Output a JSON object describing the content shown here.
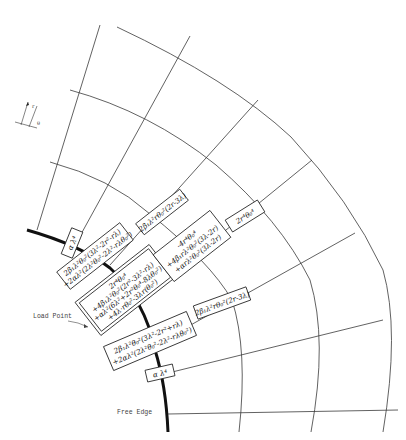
{
  "diagram": {
    "type": "finite-difference stencil on polar grid",
    "labels": {
      "load_point": "Load Point",
      "free_edge": "Free Edge"
    },
    "axes_marker": {
      "r": "r",
      "theta": "θ"
    },
    "stencil_boxes": [
      {
        "id": "alpha-top",
        "lines": [
          "α λ⁴"
        ]
      },
      {
        "id": "beta-upper-left",
        "lines": [
          "2β₁λ²θ₀²(3λ²-2r²-rλ)",
          "+2αλ²(2λ²θ₀²-2λ²-rλθ₀²)"
        ]
      },
      {
        "id": "beta-mid-upper",
        "lines": [
          "2β₁λ²rθ₀²(2r-3λ)"
        ]
      },
      {
        "id": "center-load",
        "lines": [
          "2r⁴θ₀⁴",
          "+4β₁λ²θ₀²(2r²-3λ²-rλ)",
          "+αλ²(6λ²+2r²θ₀⁴-8λθ₀²)",
          "+4λ·rθ₀²-3λr(θ₀²)"
        ]
      },
      {
        "id": "neg4r-box",
        "lines": [
          "-4r⁴θ₀⁴",
          "+4β₁rλ²θ₀²(3λ-2r)",
          "+αrλ²θ₀²(3λ-2r)"
        ]
      },
      {
        "id": "2r4-box",
        "lines": [
          "2r⁴θ₀⁴"
        ]
      },
      {
        "id": "beta-lower-left",
        "lines": [
          "2β₁λ²θ₀²(3λ²-2r²+rλ)",
          "+2αλ²(2λ²θ₀²-2λ²-rλθ₀²)"
        ]
      },
      {
        "id": "beta-mid-lower",
        "lines": [
          "2β₁λ²rθ₀²(2r-3λ)"
        ]
      },
      {
        "id": "alpha-bottom",
        "lines": [
          "α λ⁴"
        ]
      }
    ]
  }
}
